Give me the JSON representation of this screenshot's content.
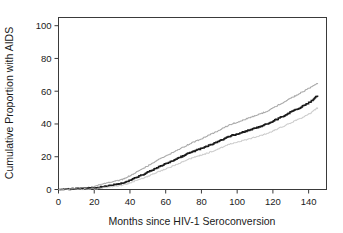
{
  "chart_data": {
    "type": "line",
    "title": "",
    "subtitle": "",
    "xlabel": "Months since HIV-1 Seroconversion",
    "ylabel": "Cumulative Proportion with AIDS",
    "xlim": [
      0,
      150
    ],
    "ylim": [
      0,
      105
    ],
    "xticks": [
      0,
      20,
      40,
      60,
      80,
      100,
      120,
      140
    ],
    "xtick_labels": [
      "0",
      "20",
      "40",
      "60",
      "80",
      "100",
      "120",
      "140"
    ],
    "yticks": [
      0,
      20,
      40,
      60,
      80,
      100
    ],
    "ytick_labels": [
      "0",
      "20",
      "40",
      "60",
      "80",
      "100"
    ],
    "grid": false,
    "legend": "none",
    "frame": "box",
    "x": [
      0,
      3,
      6,
      9,
      12,
      15,
      18,
      20,
      22,
      24,
      26,
      28,
      30,
      32,
      34,
      36,
      38,
      40,
      42,
      44,
      46,
      48,
      50,
      52,
      54,
      56,
      58,
      60,
      62,
      64,
      66,
      68,
      70,
      72,
      74,
      76,
      78,
      80,
      82,
      84,
      86,
      88,
      90,
      92,
      94,
      96,
      98,
      100,
      102,
      104,
      106,
      108,
      110,
      112,
      114,
      116,
      118,
      120,
      122,
      124,
      126,
      128,
      130,
      132,
      134,
      136,
      138,
      140,
      142,
      144,
      145
    ],
    "series": [
      {
        "name": "Upper 95% confidence limit",
        "color": "#9a9a9a",
        "values": [
          0.0,
          0.3,
          0.5,
          0.7,
          0.9,
          1.1,
          1.4,
          1.9,
          2.6,
          3.2,
          3.8,
          4.3,
          4.8,
          5.2,
          5.6,
          6.3,
          7.4,
          8.6,
          9.8,
          11.0,
          12.2,
          13.4,
          14.6,
          15.9,
          17.1,
          18.3,
          19.4,
          20.5,
          21.6,
          22.8,
          23.9,
          25.0,
          26.1,
          27.2,
          28.3,
          29.2,
          30.1,
          31.1,
          32.1,
          33.1,
          34.2,
          35.2,
          36.3,
          37.5,
          38.6,
          39.7,
          40.4,
          41.1,
          41.9,
          42.7,
          43.5,
          44.3,
          45.1,
          45.9,
          46.7,
          47.6,
          48.6,
          49.8,
          51.0,
          52.2,
          53.4,
          54.6,
          55.8,
          57.0,
          58.2,
          59.4,
          60.6,
          61.8,
          63.0,
          64.4,
          65.0
        ]
      },
      {
        "name": "Cumulative proportion with AIDS",
        "color": "#1a1a1a",
        "values": [
          0.0,
          0.2,
          0.3,
          0.4,
          0.5,
          0.6,
          0.8,
          0.9,
          1.2,
          1.6,
          2.0,
          2.4,
          2.8,
          3.1,
          3.4,
          3.9,
          4.7,
          5.6,
          6.6,
          7.6,
          8.6,
          9.6,
          10.6,
          11.7,
          12.7,
          13.7,
          14.7,
          15.7,
          16.7,
          17.7,
          18.7,
          19.7,
          20.7,
          21.7,
          22.7,
          23.5,
          24.3,
          25.1,
          25.9,
          26.8,
          27.7,
          28.6,
          29.6,
          30.7,
          31.7,
          32.7,
          33.3,
          33.9,
          34.6,
          35.3,
          36.0,
          36.7,
          37.4,
          38.1,
          38.9,
          39.7,
          40.6,
          41.7,
          42.8,
          43.9,
          45.0,
          46.1,
          47.2,
          48.3,
          49.4,
          50.5,
          51.7,
          53.0,
          54.5,
          56.5,
          57.2
        ]
      },
      {
        "name": "Lower 95% confidence limit",
        "color": "#c4c4c4",
        "values": [
          0.0,
          0.1,
          0.1,
          0.2,
          0.2,
          0.3,
          0.4,
          0.4,
          0.6,
          0.9,
          1.2,
          1.5,
          1.8,
          2.0,
          2.3,
          2.7,
          3.4,
          4.1,
          4.9,
          5.7,
          6.5,
          7.3,
          8.2,
          9.1,
          10.0,
          10.9,
          11.8,
          12.7,
          13.6,
          14.5,
          15.4,
          16.3,
          17.2,
          18.1,
          19.0,
          19.7,
          20.4,
          21.1,
          21.8,
          22.6,
          23.4,
          24.2,
          25.1,
          26.1,
          27.0,
          27.9,
          28.5,
          29.0,
          29.6,
          30.2,
          30.8,
          31.4,
          32.0,
          32.6,
          33.3,
          34.0,
          34.8,
          35.8,
          36.8,
          37.8,
          38.8,
          39.8,
          40.8,
          41.8,
          42.8,
          43.8,
          44.9,
          46.1,
          47.5,
          49.3,
          49.8
        ]
      }
    ]
  }
}
